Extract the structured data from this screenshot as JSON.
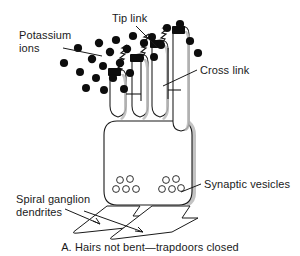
{
  "figure": {
    "caption": "A. Hairs not bent—trapdoors closed",
    "background_color": "#ffffff",
    "ink_color": "#1a1a1a"
  },
  "labels": {
    "potassium_ions": {
      "line1": "Potassium",
      "line2": "ions"
    },
    "tip_link": "Tip link",
    "cross_link": "Cross link",
    "synaptic_vesicles": "Synaptic vesicles",
    "spiral_ganglion": {
      "line1": "Spiral ganglion",
      "line2": "dendrites"
    }
  },
  "structures": {
    "hair_cell_body": "hair-cell-body",
    "stereocilia_count": 4,
    "tip_link_count": 3,
    "cross_link_count": 2,
    "vesicle_cluster_left_count": 5,
    "vesicle_cluster_right_count": 5,
    "dendrite_count": 2,
    "potassium_ion_count": 26
  },
  "potassium_ions": [
    {
      "cx": 64,
      "cy": 63,
      "r": 4.1
    },
    {
      "cx": 78,
      "cy": 48,
      "r": 4.1
    },
    {
      "cx": 80,
      "cy": 72,
      "r": 4.0
    },
    {
      "cx": 86,
      "cy": 88,
      "r": 4.0
    },
    {
      "cx": 92,
      "cy": 59,
      "r": 4.2
    },
    {
      "cx": 96,
      "cy": 78,
      "r": 4.0
    },
    {
      "cx": 99,
      "cy": 43,
      "r": 4.2
    },
    {
      "cx": 103,
      "cy": 66,
      "r": 4.0
    },
    {
      "cx": 104,
      "cy": 90,
      "r": 4.0
    },
    {
      "cx": 110,
      "cy": 52,
      "r": 4.2
    },
    {
      "cx": 113,
      "cy": 78,
      "r": 4.1
    },
    {
      "cx": 116,
      "cy": 40,
      "r": 4.1
    },
    {
      "cx": 120,
      "cy": 63,
      "r": 4.2
    },
    {
      "cx": 124,
      "cy": 89,
      "r": 4.0
    },
    {
      "cx": 127,
      "cy": 49,
      "r": 4.2
    },
    {
      "cx": 130,
      "cy": 73,
      "r": 4.1
    },
    {
      "cx": 133,
      "cy": 36,
      "r": 4.1
    },
    {
      "cx": 140,
      "cy": 58,
      "r": 4.1
    },
    {
      "cx": 144,
      "cy": 43,
      "r": 4.1
    },
    {
      "cx": 152,
      "cy": 37,
      "r": 4.0
    },
    {
      "cx": 154,
      "cy": 57,
      "r": 4.0
    },
    {
      "cx": 161,
      "cy": 45,
      "r": 4.0
    },
    {
      "cx": 167,
      "cy": 28,
      "r": 4.1
    },
    {
      "cx": 180,
      "cy": 24,
      "r": 4.1
    },
    {
      "cx": 190,
      "cy": 41,
      "r": 4.1
    },
    {
      "cx": 198,
      "cy": 53,
      "r": 4.1
    }
  ]
}
